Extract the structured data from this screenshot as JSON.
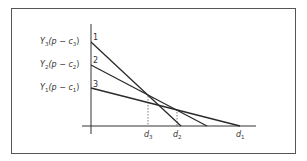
{
  "diagram": {
    "y_labels": [
      {
        "var": "Y",
        "sub": "3",
        "rest": "(p − c",
        "csub": "3",
        "close": ")",
        "num": "1"
      },
      {
        "var": "Y",
        "sub": "2",
        "rest": "(p − c",
        "csub": "2",
        "close": ")",
        "num": "2"
      },
      {
        "var": "Y",
        "sub": "1",
        "rest": "(p − c",
        "csub": "1",
        "close": ")",
        "num": "3"
      }
    ],
    "x_labels": [
      {
        "var": "d",
        "sub": "3"
      },
      {
        "var": "d",
        "sub": "2"
      },
      {
        "var": "d",
        "sub": "1"
      }
    ],
    "lines": [
      {
        "id": "1",
        "x1": 91,
        "y1": 42,
        "x2": 181,
        "y2": 126
      },
      {
        "id": "2",
        "x1": 91,
        "y1": 65,
        "x2": 207,
        "y2": 126
      },
      {
        "id": "3",
        "x1": 91,
        "y1": 88,
        "x2": 240,
        "y2": 126
      }
    ],
    "colors": {
      "line": "#2a2a2a",
      "frame": "#555555",
      "text": "#333333"
    }
  }
}
